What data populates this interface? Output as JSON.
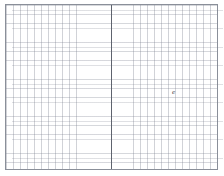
{
  "page": {
    "background_color": "#ffffff",
    "width": 224,
    "height": 176
  },
  "sheet": {
    "name": "graph-paper-sheet",
    "border_color": "#8a8f99",
    "grid_line_color": "#787d8c",
    "grid_cell_width_px": 7,
    "grid_cell_height_px": 9,
    "paper_color": "#ffffff"
  },
  "center_fold": {
    "label": "",
    "color": "#5e636e",
    "x_px": 111
  },
  "marks": [
    {
      "name": "cursor-mark",
      "glyph": "e",
      "color": "#3c3f47",
      "x_px": 171,
      "y_px": 89
    }
  ]
}
